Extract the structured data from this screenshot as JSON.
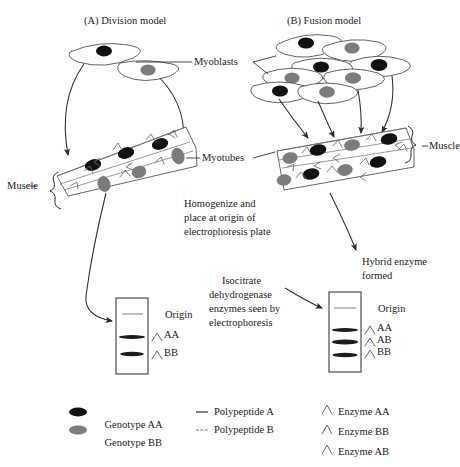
{
  "figure": {
    "panels": [
      {
        "id": "A",
        "title": "(A) Division model"
      },
      {
        "id": "B",
        "title": "(B) Fusion model"
      }
    ],
    "callouts": {
      "myoblasts": "Myoblasts",
      "myotubes": "Myotubes",
      "muscle_left": "Muscle",
      "muscle_right": "Muscle",
      "hybrid_line1": "Hybrid enzyme",
      "hybrid_line2": "formed"
    },
    "notes": {
      "homogenize": [
        "Homogenize and",
        "place at origin of",
        "electrophoresis plate"
      ],
      "isocitrate": [
        "Isocitrate",
        "dehydrogenase",
        "enzymes seen by",
        "electrophoresis"
      ]
    },
    "gels": {
      "left": {
        "origin_label": "Origin",
        "bands": [
          {
            "label": "AA",
            "symbol": "chevron"
          },
          {
            "label": "BB",
            "symbol": "chevron"
          }
        ]
      },
      "right": {
        "origin_label": "Origin",
        "bands": [
          {
            "label": "AA",
            "symbol": "chevron"
          },
          {
            "label": "AB",
            "symbol": "chevron"
          },
          {
            "label": "BB",
            "symbol": "chevron"
          }
        ]
      }
    },
    "legend": {
      "genotypes": [
        {
          "prefix": "Genotype",
          "italic": "AA",
          "swatch": "dark-ellipse"
        },
        {
          "prefix": "Genotype",
          "italic": "BB",
          "swatch": "gray-ellipse"
        }
      ],
      "polypeptides": [
        {
          "label": "Polypeptide A",
          "swatch": "solid-dash"
        },
        {
          "label": "Polypeptide B",
          "swatch": "light-dash"
        }
      ],
      "enzymes": [
        {
          "label": "Enzyme AA",
          "swatch": "chevron"
        },
        {
          "label": "Enzyme BB",
          "swatch": "chevron"
        },
        {
          "label": "Enzyme AB",
          "swatch": "chevron"
        }
      ]
    },
    "colors": {
      "genotype_aa": "#111111",
      "genotype_bb": "#7c7c7c",
      "ink": "#2b2b2b"
    }
  }
}
